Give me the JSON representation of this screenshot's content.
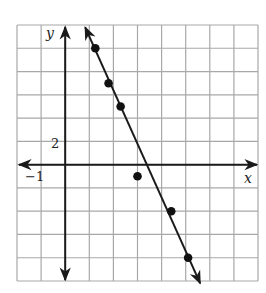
{
  "chart_data": {
    "type": "scatter",
    "title": "",
    "xlabel": "x",
    "ylabel": "y",
    "x_tick_labels": [
      {
        "value": -1,
        "label": "−1"
      }
    ],
    "y_tick_labels": [
      {
        "value": 2,
        "label": "2"
      }
    ],
    "grid": true,
    "grid_x_step": 1,
    "grid_y_step": 2,
    "xlim": [
      -2,
      8
    ],
    "ylim": [
      -10,
      12
    ],
    "points": [
      {
        "x": 1.25,
        "y": 10
      },
      {
        "x": 1.8,
        "y": 7
      },
      {
        "x": 2.3,
        "y": 5
      },
      {
        "x": 3,
        "y": -1
      },
      {
        "x": 4.4,
        "y": -4
      },
      {
        "x": 5.1,
        "y": -8
      }
    ],
    "fit_line": {
      "description": "line of best fit with arrows at both ends",
      "start": {
        "x": 0.83,
        "y": 11.8
      },
      "end": {
        "x": 5.6,
        "y": -10.2
      }
    },
    "legend": null
  },
  "colors": {
    "grid": "#a8a8a8",
    "axis": "#1a1a1a",
    "points": "#111111",
    "background": "#ffffff"
  }
}
